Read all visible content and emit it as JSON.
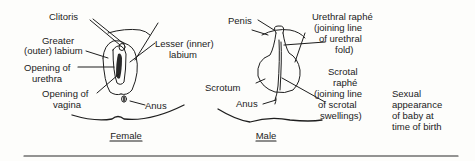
{
  "female": {
    "caption": "Female",
    "labels": {
      "clitoris": "Clitoris",
      "greater_labium_1": "Greater",
      "greater_labium_2": "(outer) labium",
      "lesser_labium_1": "Lesser (inner)",
      "lesser_labium_2": "labium",
      "urethra_1": "Opening of",
      "urethra_2": "urethra",
      "vagina_1": "Opening of",
      "vagina_2": "vagina",
      "anus": "Anus"
    }
  },
  "male": {
    "caption": "Male",
    "labels": {
      "penis": "Penis",
      "urethral_raphe_1": "Urethral raphé",
      "urethral_raphe_2": "(joining line",
      "urethral_raphe_3": "of urethral",
      "urethral_raphe_4": "fold)",
      "scrotum": "Scrotum",
      "scrotal_raphe_1": "Scrotal",
      "scrotal_raphe_2": "raphé",
      "scrotal_raphe_3": "(joining line",
      "scrotal_raphe_4": "of scrotal",
      "scrotal_raphe_5": "swellings)",
      "anus": "Anus"
    }
  },
  "side_note": {
    "line_1": "Sexual",
    "line_2": "appearance",
    "line_3": "of baby at",
    "line_4": "time of birth"
  }
}
